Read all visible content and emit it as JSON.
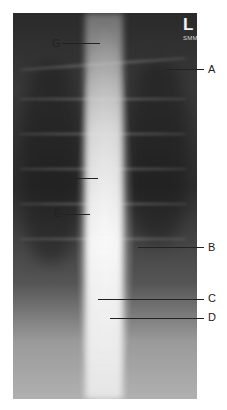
{
  "image": {
    "description": "Frontal (PA) spine radiograph with labeled anatomical markers",
    "side_marker": "L",
    "side_marker_sub": "SMM"
  },
  "labels": [
    {
      "id": "G",
      "text": "G",
      "side": "left",
      "text_x": 52,
      "text_y": 38,
      "line_x1": 62,
      "line_x2": 100,
      "line_y": 43
    },
    {
      "id": "A",
      "text": "A",
      "side": "right",
      "text_x": 208,
      "text_y": 64,
      "line_x1": 166,
      "line_x2": 204,
      "line_y": 69
    },
    {
      "id": "F",
      "text": "F",
      "side": "left",
      "text_x": 54,
      "text_y": 173,
      "line_x1": 62,
      "line_x2": 98,
      "line_y": 178
    },
    {
      "id": "E",
      "text": "E",
      "side": "left",
      "text_x": 54,
      "text_y": 208,
      "line_x1": 62,
      "line_x2": 90,
      "line_y": 214
    },
    {
      "id": "B",
      "text": "B",
      "side": "right",
      "text_x": 208,
      "text_y": 242,
      "line_x1": 138,
      "line_x2": 204,
      "line_y": 247
    },
    {
      "id": "C",
      "text": "C",
      "side": "right",
      "text_x": 208,
      "text_y": 293,
      "line_x1": 98,
      "line_x2": 204,
      "line_y": 299
    },
    {
      "id": "D",
      "text": "D",
      "side": "right",
      "text_x": 208,
      "text_y": 312,
      "line_x1": 110,
      "line_x2": 204,
      "line_y": 318
    }
  ]
}
